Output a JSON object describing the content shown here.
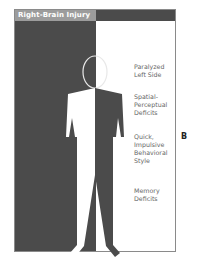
{
  "figure": {
    "title": "Right-Brain Injury",
    "panel_letter": "B",
    "colors": {
      "dark_panel": "#4b4b4b",
      "title_bg": "#9c9c9c",
      "label_text": "#666666"
    },
    "labels": [
      {
        "lines": [
          "Paralyzed",
          "Left Side"
        ]
      },
      {
        "lines": [
          "Spatial-",
          "Perceptual",
          "Deficits"
        ]
      },
      {
        "lines": [
          "Quick,",
          "Impulsive",
          "Behavioral",
          "Style"
        ]
      },
      {
        "lines": [
          "Memory",
          "Deficits"
        ]
      }
    ]
  }
}
